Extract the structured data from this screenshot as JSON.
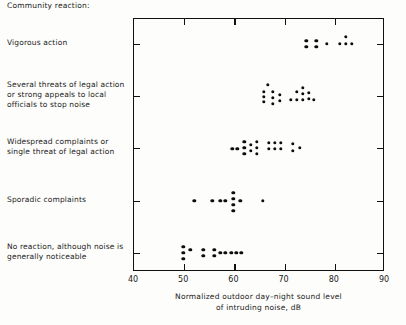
{
  "header": {
    "title": "Community reaction:"
  },
  "categories": [
    {
      "label": "Vigorous action",
      "y": 43
    },
    {
      "label": "Several threats of legal action or strong appeals to local officials to stop noise",
      "y": 95
    },
    {
      "label": "Widespread complaints or single threat of legal action",
      "y": 147
    },
    {
      "label": "Sporadic complaints",
      "y": 200
    },
    {
      "label": "No reaction, although noise is generally noticeable",
      "y": 252
    }
  ],
  "axis": {
    "x_title_line1": "Normalized outdoor day–night sound level",
    "x_title_line2": "of intruding noise, dB",
    "x_ticks": [
      "40",
      "50",
      "60",
      "70",
      "80",
      "90"
    ]
  },
  "chart_data": {
    "type": "scatter",
    "title": "",
    "xlabel": "Normalized outdoor day–night sound level of intruding noise, dB",
    "ylabel": "Community reaction:",
    "xlim": [
      40,
      90
    ],
    "grid": false,
    "legend": false,
    "x_ticks": [
      40,
      50,
      60,
      70,
      80,
      90
    ],
    "y_categories": [
      "No reaction, although noise is generally noticeable",
      "Sporadic complaints",
      "Widespread complaints or single threat of legal action",
      "Several threats of legal action or strong appeals to local officials to stop noise",
      "Vigorous action"
    ],
    "series": [
      {
        "name": "Vigorous action",
        "category": "Vigorous action",
        "points": [
          {
            "x": 74.3,
            "jitter": -3
          },
          {
            "x": 74.3,
            "jitter": 3
          },
          {
            "x": 76.3,
            "jitter": -3
          },
          {
            "x": 76.3,
            "jitter": 3
          },
          {
            "x": 78.4,
            "jitter": 0
          },
          {
            "x": 81.0,
            "jitter": 0
          },
          {
            "x": 82.2,
            "jitter": 0
          },
          {
            "x": 83.4,
            "jitter": 0
          },
          {
            "x": 82.2,
            "jitter": -7
          }
        ]
      },
      {
        "name": "Several threats of legal action",
        "category": "Several threats of legal action or strong appeals to local officials to stop noise",
        "points": [
          {
            "x": 66.6,
            "jitter": -11
          },
          {
            "x": 65.8,
            "jitter": -4
          },
          {
            "x": 65.8,
            "jitter": 1
          },
          {
            "x": 65.8,
            "jitter": 6
          },
          {
            "x": 67.6,
            "jitter": -4
          },
          {
            "x": 67.6,
            "jitter": 2
          },
          {
            "x": 67.6,
            "jitter": 8
          },
          {
            "x": 69.0,
            "jitter": -1
          },
          {
            "x": 69.0,
            "jitter": 5
          },
          {
            "x": 71.2,
            "jitter": 4
          },
          {
            "x": 72.4,
            "jitter": -4
          },
          {
            "x": 72.4,
            "jitter": 4
          },
          {
            "x": 73.6,
            "jitter": -8
          },
          {
            "x": 73.6,
            "jitter": -2
          },
          {
            "x": 73.6,
            "jitter": 4
          },
          {
            "x": 74.8,
            "jitter": -3
          },
          {
            "x": 74.8,
            "jitter": 3
          },
          {
            "x": 75.8,
            "jitter": 4
          }
        ]
      },
      {
        "name": "Widespread complaints",
        "category": "Widespread complaints or single threat of legal action",
        "points": [
          {
            "x": 59.6,
            "jitter": 1
          },
          {
            "x": 60.6,
            "jitter": 1
          },
          {
            "x": 62.0,
            "jitter": -6
          },
          {
            "x": 62.0,
            "jitter": 0
          },
          {
            "x": 62.0,
            "jitter": 6
          },
          {
            "x": 63.3,
            "jitter": -3
          },
          {
            "x": 63.3,
            "jitter": 3
          },
          {
            "x": 64.5,
            "jitter": -6
          },
          {
            "x": 64.5,
            "jitter": 0
          },
          {
            "x": 64.5,
            "jitter": 6
          },
          {
            "x": 66.8,
            "jitter": -5
          },
          {
            "x": 66.8,
            "jitter": 1
          },
          {
            "x": 68.0,
            "jitter": -5
          },
          {
            "x": 68.0,
            "jitter": 1
          },
          {
            "x": 69.2,
            "jitter": -5
          },
          {
            "x": 69.2,
            "jitter": 1
          },
          {
            "x": 71.6,
            "jitter": -4
          },
          {
            "x": 71.6,
            "jitter": 3
          },
          {
            "x": 73.0,
            "jitter": 0
          }
        ]
      },
      {
        "name": "Sporadic complaints",
        "category": "Sporadic complaints",
        "points": [
          {
            "x": 52.0,
            "jitter": 0
          },
          {
            "x": 55.6,
            "jitter": 0
          },
          {
            "x": 57.2,
            "jitter": 0
          },
          {
            "x": 58.2,
            "jitter": 0
          },
          {
            "x": 59.8,
            "jitter": -8
          },
          {
            "x": 59.8,
            "jitter": -2
          },
          {
            "x": 59.8,
            "jitter": 4
          },
          {
            "x": 59.8,
            "jitter": 10
          },
          {
            "x": 61.2,
            "jitter": 0
          },
          {
            "x": 65.6,
            "jitter": 0
          }
        ]
      },
      {
        "name": "No reaction",
        "category": "No reaction, although noise is generally noticeable",
        "points": [
          {
            "x": 49.8,
            "jitter": -6
          },
          {
            "x": 49.8,
            "jitter": 0
          },
          {
            "x": 49.8,
            "jitter": 6
          },
          {
            "x": 51.2,
            "jitter": -3
          },
          {
            "x": 53.8,
            "jitter": -3
          },
          {
            "x": 53.8,
            "jitter": 3
          },
          {
            "x": 56.0,
            "jitter": -3
          },
          {
            "x": 56.0,
            "jitter": 3
          },
          {
            "x": 57.2,
            "jitter": 0
          },
          {
            "x": 58.2,
            "jitter": 0
          },
          {
            "x": 59.4,
            "jitter": 0
          },
          {
            "x": 60.4,
            "jitter": 0
          },
          {
            "x": 61.4,
            "jitter": 0
          }
        ]
      }
    ]
  }
}
